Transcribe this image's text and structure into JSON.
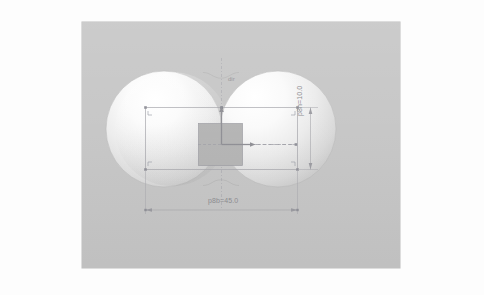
{
  "app": {
    "view_name": "cad-viewport",
    "background_color": "#c6c6c6",
    "paper_color": "#fdfdfd"
  },
  "model": {
    "name": "peanut-extrusion",
    "description": "Two overlapping circular lobes joined by a filleted neck, shaded solid",
    "fill_light": "#ffffff",
    "fill_dark": "#c2c2c2",
    "edge_color": "#b4b4b4"
  },
  "sketch": {
    "name": "sketch-rectangle",
    "line_color": "#a9a9ae",
    "construction_color": "#b0b0b6",
    "point_color": "#9596a0",
    "center_square_fill": "#b3b3b3",
    "center_square_stroke": "#9d9da3"
  },
  "dimensions": [
    {
      "name": "horizontal-dimension",
      "label": "p8b=45.0",
      "parameter": "p8b",
      "value": "45.0",
      "orientation": "horizontal"
    },
    {
      "name": "vertical-dimension",
      "label": "p8h=10.0",
      "parameter": "p8h",
      "value": "10.0",
      "orientation": "vertical"
    }
  ],
  "origin": {
    "name": "origin-marker",
    "axis_label": "dir",
    "arrow_color": "#8e8e94"
  }
}
